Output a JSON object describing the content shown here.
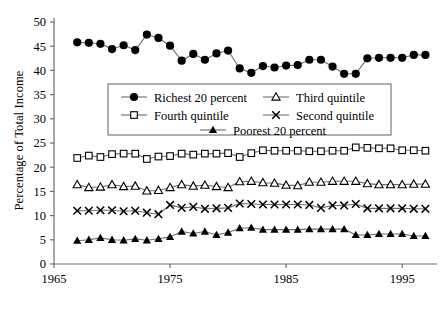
{
  "chart_data": {
    "type": "line",
    "title": "",
    "xlabel": "",
    "ylabel": "Percentage of Total Income",
    "xlim": [
      1965,
      1998
    ],
    "ylim": [
      0,
      50
    ],
    "xticks": [
      1965,
      1975,
      1985,
      1995
    ],
    "xtick_labels": [
      "1965",
      "1975",
      "1985",
      "1995"
    ],
    "yticks": [
      0,
      5,
      10,
      15,
      20,
      25,
      30,
      35,
      40,
      45,
      50
    ],
    "ytick_labels": [
      "0",
      "5",
      "10",
      "15",
      "20",
      "25",
      "30",
      "35",
      "40",
      "45",
      "50"
    ],
    "grid": false,
    "legend_position": "upper-center",
    "line_color": "#6e6e6e",
    "marker_color": "#000000",
    "x": [
      1967,
      1968,
      1969,
      1970,
      1971,
      1972,
      1973,
      1974,
      1975,
      1976,
      1977,
      1978,
      1979,
      1980,
      1981,
      1982,
      1983,
      1984,
      1985,
      1986,
      1987,
      1988,
      1989,
      1990,
      1991,
      1992,
      1993,
      1994,
      1995,
      1996,
      1997
    ],
    "series": [
      {
        "name": "Richest 20 percent",
        "marker": "filled-circle",
        "values": [
          45.8,
          45.7,
          45.5,
          44.4,
          45.2,
          44.2,
          47.4,
          46.7,
          45.1,
          42.0,
          43.4,
          42.2,
          43.5,
          44.1,
          40.4,
          39.5,
          40.9,
          40.6,
          41.0,
          41.1,
          42.2,
          42.2,
          40.8,
          39.3,
          39.3,
          42.5,
          42.6,
          42.6,
          42.6,
          43.2,
          43.2
        ]
      },
      {
        "name": "Fourth quintile",
        "marker": "open-square",
        "values": [
          21.9,
          22.4,
          22.1,
          22.7,
          22.8,
          22.8,
          21.7,
          22.2,
          22.3,
          22.8,
          22.6,
          22.8,
          22.8,
          22.9,
          22.1,
          22.9,
          23.5,
          23.4,
          23.4,
          23.4,
          23.3,
          23.3,
          23.4,
          23.4,
          24.1,
          24.0,
          23.9,
          23.9,
          23.5,
          23.5,
          23.4
        ]
      },
      {
        "name": "Third quintile",
        "marker": "open-triangle",
        "values": [
          16.4,
          15.8,
          15.9,
          16.4,
          16.0,
          16.1,
          15.1,
          15.2,
          15.8,
          16.4,
          16.1,
          16.3,
          16.0,
          15.8,
          17.0,
          17.1,
          16.8,
          16.7,
          16.3,
          16.2,
          16.9,
          16.9,
          17.1,
          17.1,
          17.1,
          16.6,
          16.4,
          16.4,
          16.4,
          16.5,
          16.5
        ]
      },
      {
        "name": "Second quintile",
        "marker": "x-cross",
        "values": [
          11.0,
          11.0,
          11.1,
          11.1,
          10.9,
          11.0,
          10.6,
          10.3,
          12.2,
          11.6,
          11.8,
          11.4,
          11.5,
          11.6,
          12.5,
          12.4,
          12.3,
          12.3,
          12.3,
          12.3,
          12.2,
          11.6,
          12.1,
          12.1,
          12.4,
          11.5,
          11.5,
          11.5,
          11.5,
          11.4,
          11.4
        ]
      },
      {
        "name": "Poorest 20 percent",
        "marker": "filled-triangle",
        "values": [
          4.8,
          5.0,
          5.4,
          5.0,
          4.9,
          5.2,
          4.9,
          5.2,
          5.6,
          6.7,
          6.3,
          6.7,
          6.0,
          6.5,
          7.4,
          7.5,
          7.1,
          7.1,
          7.1,
          7.1,
          7.2,
          7.2,
          7.2,
          7.2,
          6.0,
          6.0,
          6.2,
          6.2,
          6.2,
          5.8,
          5.8
        ]
      }
    ],
    "legend": [
      {
        "label": "Richest 20 percent",
        "marker": "filled-circle"
      },
      {
        "label": "Third quintile",
        "marker": "open-triangle"
      },
      {
        "label": "Fourth quintile",
        "marker": "open-square"
      },
      {
        "label": "Second quintile",
        "marker": "x-cross"
      },
      {
        "label": "Poorest 20 percent",
        "marker": "filled-triangle"
      }
    ]
  }
}
